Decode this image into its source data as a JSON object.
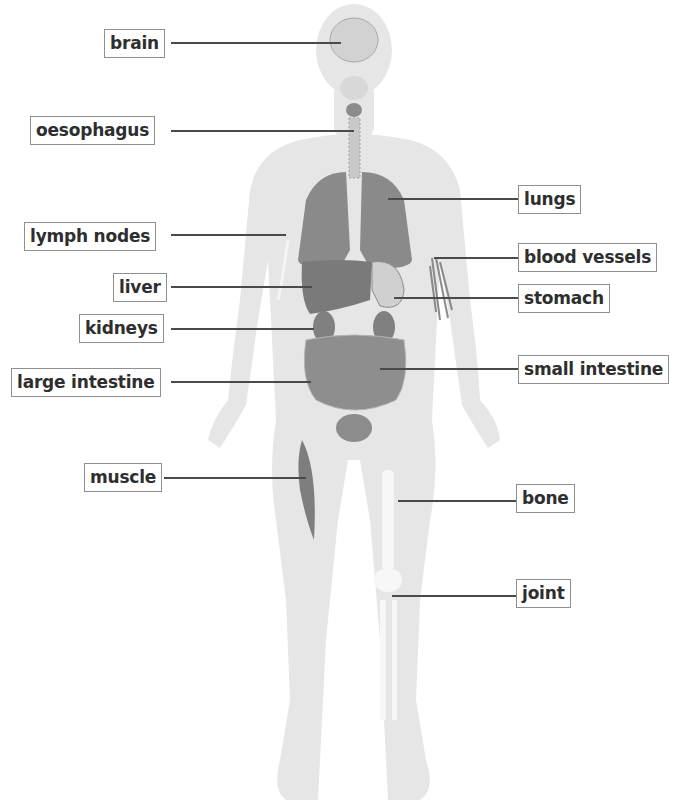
{
  "diagram": {
    "figure": "semi-transparent human body silhouette with internal organs",
    "colors": {
      "body": "#e4e4e4",
      "organ_dark": "#7a7a7a",
      "organ_mid": "#9a9a9a",
      "bone": "#f6f6f6",
      "label_border": "#8f8f8f",
      "line": "#4a4a4a",
      "text": "#2e2e2e"
    },
    "labels_left": [
      {
        "id": "brain",
        "text": "brain"
      },
      {
        "id": "oesophagus",
        "text": "oesophagus"
      },
      {
        "id": "lymph-nodes",
        "text": "lymph nodes"
      },
      {
        "id": "liver",
        "text": "liver"
      },
      {
        "id": "kidneys",
        "text": "kidneys"
      },
      {
        "id": "large-intestine",
        "text": "large intestine"
      },
      {
        "id": "muscle",
        "text": "muscle"
      }
    ],
    "labels_right": [
      {
        "id": "lungs",
        "text": "lungs"
      },
      {
        "id": "blood-vessels",
        "text": "blood vessels"
      },
      {
        "id": "stomach",
        "text": "stomach"
      },
      {
        "id": "small-intestine",
        "text": "small intestine"
      },
      {
        "id": "bone",
        "text": "bone"
      },
      {
        "id": "joint",
        "text": "joint"
      }
    ]
  }
}
